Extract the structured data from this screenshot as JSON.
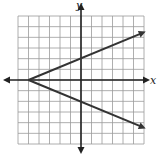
{
  "chart_data": {
    "type": "line",
    "title": "",
    "xlabel": "x",
    "ylabel": "y",
    "xlim": [
      -6,
      6
    ],
    "ylim": [
      -6,
      6
    ],
    "grid": true,
    "grid_step": 1,
    "series": [
      {
        "name": "upper ray",
        "points": [
          [
            -5,
            0
          ],
          [
            6,
            4.4
          ]
        ],
        "equation": "y = (2/5)(x + 5)"
      },
      {
        "name": "lower ray",
        "points": [
          [
            -5,
            0
          ],
          [
            6,
            -4.4
          ]
        ],
        "equation": "y = -(2/5)(x + 5)"
      }
    ],
    "vertex": [
      -5,
      0
    ],
    "legend": null
  },
  "axes": {
    "x_label": "x",
    "y_label": "y"
  },
  "colors": {
    "grid": "#9a9a9a",
    "axis": "#222222",
    "line": "#333333"
  }
}
